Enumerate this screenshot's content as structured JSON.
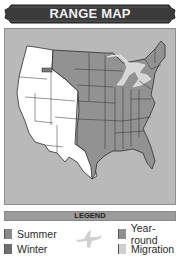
{
  "header": {
    "title": "RANGE MAP"
  },
  "map": {
    "region": "Contiguous United States",
    "colors": {
      "background": "#b9b9b9",
      "no_range": "#ffffff",
      "summer": "#8a8a8a",
      "year_round": "#959595",
      "migration": "#d9d9d9",
      "borders": "#2f2f2f"
    }
  },
  "legend": {
    "title": "LEGEND",
    "items": [
      {
        "label": "Summer",
        "color": "#8a8a8a"
      },
      {
        "label": "Winter",
        "color": "#6e6e6e"
      },
      {
        "label": "Year-round",
        "color": "#909090"
      },
      {
        "label": "Migration",
        "color": "#cfcfcf"
      }
    ],
    "icon": "bird-silhouette-icon"
  }
}
